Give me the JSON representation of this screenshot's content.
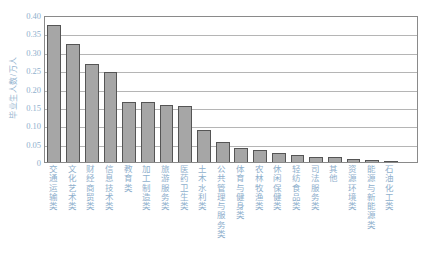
{
  "chart_data": {
    "type": "bar",
    "title": "",
    "subtitle": "",
    "xlabel": "",
    "ylabel": "毕业生人数/万人",
    "ylim": [
      0,
      0.4
    ],
    "ytick_labels": [
      "0.40",
      "0.35",
      "0.30",
      "0.25",
      "0.20",
      "0.15",
      "0.10",
      "0.05",
      "0"
    ],
    "ytick_values": [
      0.4,
      0.35,
      0.3,
      0.25,
      0.2,
      0.15,
      0.1,
      0.05,
      0
    ],
    "grid": true,
    "legend": "none",
    "bar_color": "#a6a6a6",
    "bar_edge_color": "#555555",
    "axis_color": "#8a8a8a",
    "label_color": "#8fb0cd",
    "categories": [
      "交通运输类",
      "文化艺术类",
      "财经商贸类",
      "信息技术类",
      "教育类",
      "加工制造类",
      "旅游服务类",
      "医药卫生类",
      "土木水利类",
      "公共管理与服务类",
      "体育与健身类",
      "农林牧渔类",
      "休闲保健类",
      "轻纺食品类",
      "司法服务类",
      "其他",
      "资源环境类",
      "能源与新能源类",
      "石油化工类"
    ],
    "values": [
      0.372,
      0.322,
      0.266,
      0.245,
      0.163,
      0.162,
      0.154,
      0.153,
      0.086,
      0.054,
      0.039,
      0.032,
      0.025,
      0.019,
      0.015,
      0.013,
      0.008,
      0.006,
      0.002
    ]
  }
}
